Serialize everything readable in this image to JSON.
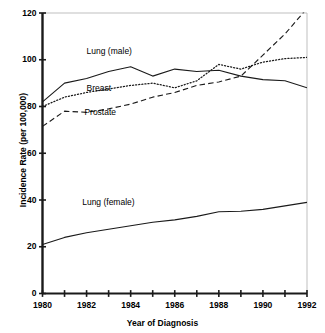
{
  "chart_data": {
    "type": "line",
    "title": "",
    "xlabel": "Year of Diagnosis",
    "ylabel": "Incidence Rate (per 100,000)",
    "xlim": [
      1980,
      1992
    ],
    "ylim": [
      0,
      120
    ],
    "xticks": [
      1980,
      1981,
      1982,
      1983,
      1984,
      1985,
      1986,
      1987,
      1988,
      1989,
      1990,
      1991,
      1992
    ],
    "xtick_labels": [
      "1980",
      "",
      "1982",
      "",
      "1984",
      "",
      "1986",
      "",
      "1988",
      "",
      "1990",
      "",
      "1992"
    ],
    "yticks": [
      0,
      20,
      40,
      60,
      80,
      100,
      120
    ],
    "ytick_labels": [
      "0",
      "20",
      "40",
      "60",
      "80",
      "100",
      "120"
    ],
    "grid": false,
    "legend": "inline-labels",
    "x": [
      1980,
      1981,
      1982,
      1983,
      1984,
      1985,
      1986,
      1987,
      1988,
      1989,
      1990,
      1991,
      1992
    ],
    "series": [
      {
        "name": "Lung (male)",
        "style": "solid",
        "label_x": 1982.0,
        "label_y": 103.5,
        "values": [
          82,
          90,
          92,
          95,
          97,
          93,
          96,
          95,
          95.5,
          93,
          91.5,
          91,
          88
        ]
      },
      {
        "name": "Breast",
        "style": "dotted",
        "label_x": 1982.0,
        "label_y": 87.5,
        "values": [
          80,
          84,
          86,
          87.5,
          89,
          90,
          88,
          91,
          98,
          96,
          99,
          100.5,
          101
        ]
      },
      {
        "name": "Prostate",
        "style": "dashed",
        "label_x": 1981.9,
        "label_y": 77.5,
        "values": [
          71.5,
          78,
          77.5,
          79,
          81,
          84,
          86,
          89,
          90.5,
          93,
          102,
          111,
          122
        ]
      },
      {
        "name": "Lung (female)",
        "style": "solid",
        "label_x": 1981.8,
        "label_y": 39.0,
        "values": [
          21,
          24,
          26,
          27.5,
          29,
          30.5,
          31.5,
          33,
          35,
          35.2,
          36,
          37.5,
          39
        ]
      }
    ]
  }
}
